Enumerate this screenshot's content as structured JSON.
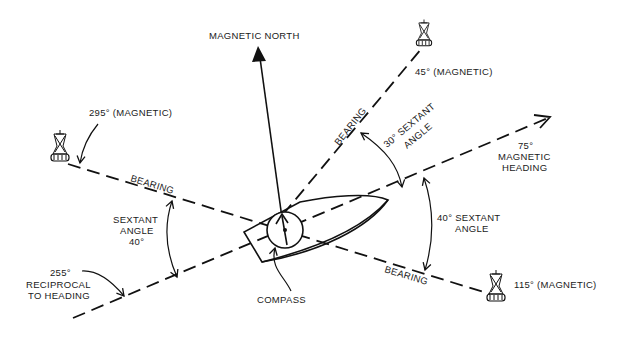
{
  "labels": {
    "magnetic_north": "MAGNETIC NORTH",
    "bearing_45": "45° (MAGNETIC)",
    "bearing_295": "295° (MAGNETIC)",
    "bearing_115": "115° (MAGNETIC)",
    "bearing_a": "BEARING",
    "bearing_b": "BEARING",
    "bearing_c": "BEARING",
    "sextant_30_line1": "30° SEXTANT",
    "sextant_30_line2": "ANGLE",
    "heading_line1": "75°",
    "heading_line2": "MAGNETIC",
    "heading_line3": "HEADING",
    "sextant_40_left_line1": "SEXTANT",
    "sextant_40_left_line2": "ANGLE",
    "sextant_40_left_line3": "40°",
    "sextant_40_right_line1": "40° SEXTANT",
    "sextant_40_right_line2": "ANGLE",
    "reciprocal_line1": "255°",
    "reciprocal_line2": "RECIPROCAL",
    "reciprocal_line3": "TO HEADING",
    "compass": "COMPASS"
  },
  "colors": {
    "ink": "#111111",
    "background": "#ffffff"
  }
}
